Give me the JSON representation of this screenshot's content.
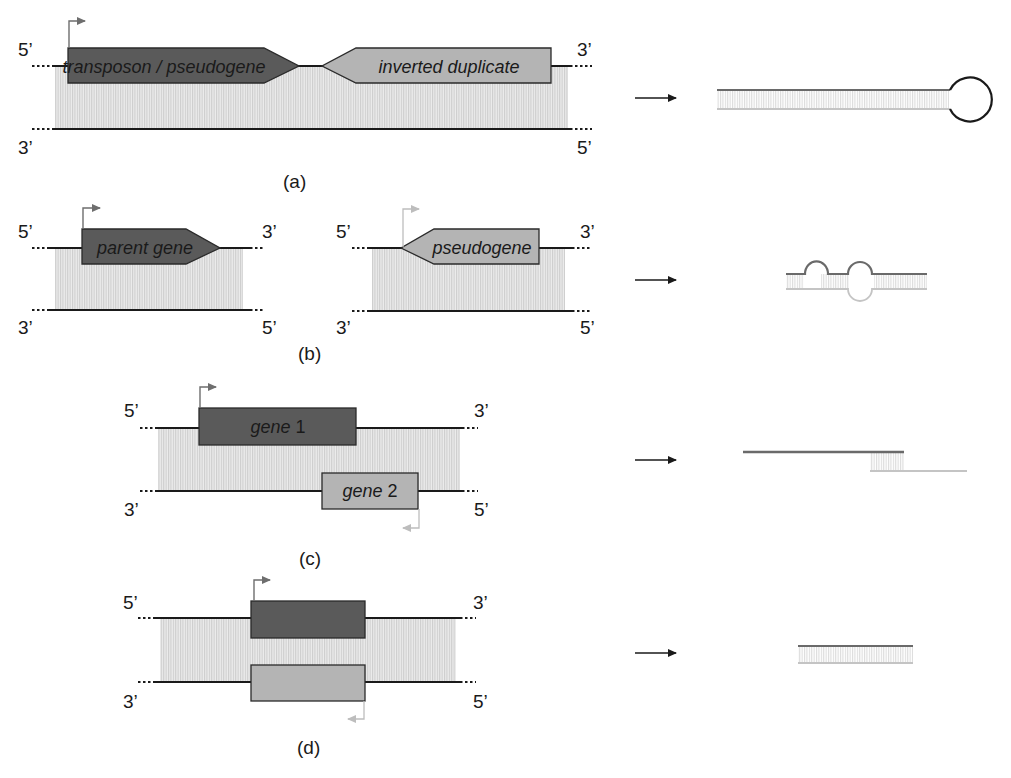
{
  "colors": {
    "strand": "#1a1a1a",
    "dark_gene": "#5a5a5a",
    "light_gene": "#b4b4b4",
    "gene_border": "#2a2a2a",
    "hatch": "#d2d2d2",
    "promoter_dark": "#6e6e6e",
    "promoter_light": "#bdbdbd",
    "product_dark": "#6a6a6a",
    "product_light": "#c4c4c4",
    "arrow": "#1a1a1a"
  },
  "end_labels": {
    "five": "5’",
    "three": "3’"
  },
  "panels": [
    {
      "id": "a",
      "caption": "(a)",
      "genes": [
        {
          "label": "transposon / pseudogene",
          "shade": "dark",
          "direction": "right"
        },
        {
          "label": "inverted duplicate",
          "shade": "light",
          "direction": "left"
        }
      ],
      "product": "hairpin dsRNA"
    },
    {
      "id": "b",
      "caption": "(b)",
      "genes": [
        {
          "label": "parent gene",
          "shade": "dark",
          "direction": "right"
        },
        {
          "label": "pseudogene",
          "shade": "light",
          "direction": "left"
        }
      ],
      "product": "imperfect duplex with bulges"
    },
    {
      "id": "c",
      "caption": "(c)",
      "genes": [
        {
          "label_word": "gene",
          "label_num": " 1",
          "shade": "dark",
          "strand": "top"
        },
        {
          "label_word": "gene",
          "label_num": " 2",
          "shade": "light",
          "strand": "bottom"
        }
      ],
      "product": "partial overlap duplex"
    },
    {
      "id": "d",
      "caption": "(d)",
      "genes": [
        {
          "label": "",
          "shade": "dark",
          "strand": "top"
        },
        {
          "label": "",
          "shade": "light",
          "strand": "bottom"
        }
      ],
      "product": "full duplex"
    }
  ]
}
